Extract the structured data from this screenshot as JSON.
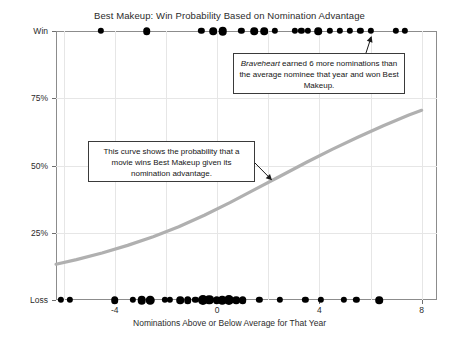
{
  "chart_data": {
    "type": "scatter",
    "title": "Best Makeup: Win Probability Based on Nomination Advantage",
    "xlabel": "Nominations Above or Below Average for That Year",
    "ylabel": "",
    "xlim": [
      -6.3,
      8.6
    ],
    "ylim": [
      0,
      1
    ],
    "grid": true,
    "legend": "none",
    "xticks": [
      -4,
      0,
      4,
      8
    ],
    "xtick_labels": [
      "-4",
      "0",
      "4",
      "8"
    ],
    "yticks": [
      0,
      0.25,
      0.5,
      0.75,
      1
    ],
    "ytick_labels": [
      "Loss",
      "25%",
      "50%",
      "75%",
      "Win"
    ],
    "series": [
      {
        "name": "Winners",
        "y_value": 1,
        "points": [
          {
            "x": -4.55,
            "count": 1
          },
          {
            "x": -2.75,
            "count": 2
          },
          {
            "x": -0.62,
            "count": 1
          },
          {
            "x": -0.15,
            "count": 2
          },
          {
            "x": 0.22,
            "count": 3
          },
          {
            "x": 0.95,
            "count": 1
          },
          {
            "x": 1.45,
            "count": 2
          },
          {
            "x": 1.85,
            "count": 2
          },
          {
            "x": 2.25,
            "count": 1
          },
          {
            "x": 3.05,
            "count": 1
          },
          {
            "x": 3.3,
            "count": 1
          },
          {
            "x": 3.55,
            "count": 1
          },
          {
            "x": 3.95,
            "count": 2
          },
          {
            "x": 4.4,
            "count": 1
          },
          {
            "x": 4.8,
            "count": 1
          },
          {
            "x": 5.2,
            "count": 1
          },
          {
            "x": 5.6,
            "count": 1
          },
          {
            "x": 6.0,
            "count": 1
          },
          {
            "x": 7.0,
            "count": 1
          },
          {
            "x": 7.35,
            "count": 1
          }
        ]
      },
      {
        "name": "Losers",
        "y_value": 0,
        "points": [
          {
            "x": -6.1,
            "count": 1
          },
          {
            "x": -5.75,
            "count": 1
          },
          {
            "x": -4.0,
            "count": 2
          },
          {
            "x": -3.3,
            "count": 1
          },
          {
            "x": -2.95,
            "count": 3
          },
          {
            "x": -2.62,
            "count": 3
          },
          {
            "x": -2.05,
            "count": 1
          },
          {
            "x": -1.85,
            "count": 1
          },
          {
            "x": -1.45,
            "count": 2
          },
          {
            "x": -1.15,
            "count": 2
          },
          {
            "x": -0.85,
            "count": 1
          },
          {
            "x": -0.55,
            "count": 5
          },
          {
            "x": -0.3,
            "count": 4
          },
          {
            "x": -0.02,
            "count": 2
          },
          {
            "x": 0.2,
            "count": 3
          },
          {
            "x": 0.45,
            "count": 5
          },
          {
            "x": 0.75,
            "count": 2
          },
          {
            "x": 1.0,
            "count": 2
          },
          {
            "x": 1.65,
            "count": 1
          },
          {
            "x": 2.45,
            "count": 1
          },
          {
            "x": 3.45,
            "count": 1
          },
          {
            "x": 4.05,
            "count": 1
          },
          {
            "x": 4.95,
            "count": 1
          },
          {
            "x": 5.45,
            "count": 1
          },
          {
            "x": 6.35,
            "count": 2
          }
        ]
      }
    ],
    "fit_curve": {
      "name": "Logistic win probability",
      "color": "#b0b0b0",
      "x": [
        -6.3,
        -5.5,
        -4.5,
        -3.5,
        -2.5,
        -1.5,
        -0.5,
        0.5,
        1.5,
        2.5,
        3.5,
        4.5,
        5.5,
        6.5,
        7.5,
        8.0
      ],
      "y": [
        0.133,
        0.15,
        0.175,
        0.203,
        0.235,
        0.272,
        0.315,
        0.362,
        0.412,
        0.462,
        0.512,
        0.56,
        0.605,
        0.648,
        0.688,
        0.705
      ]
    },
    "annotations": [
      {
        "id": "braveheart-note",
        "text_prefix": "",
        "emphasis": "Braveheart",
        "text": " earned 6 more nominations than the average nominee that year and won Best Makeup.",
        "points_to": {
          "x": 6.0,
          "y": 1
        }
      },
      {
        "id": "curve-note",
        "text": "This curve shows the probability that a movie wins Best Makeup given its nomination advantage.",
        "points_to": {
          "x": 2.15,
          "y": 0.445
        }
      }
    ]
  }
}
